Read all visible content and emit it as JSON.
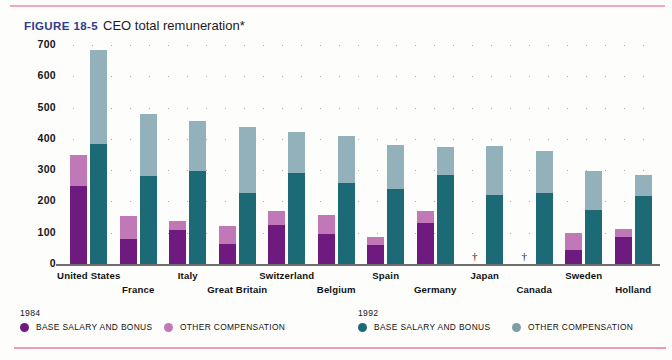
{
  "figure": {
    "label": "FIGURE 18-5",
    "title": "CEO total remuneration*"
  },
  "legend": {
    "year_1984": "1984",
    "year_1992": "1992",
    "entries": [
      {
        "year": "1984",
        "label": "BASE SALARY AND BONUS",
        "color": "#6e1a7e"
      },
      {
        "year": "1984",
        "label": "OTHER COMPENSATION",
        "color": "#c078b6"
      },
      {
        "year": "1992",
        "label": "BASE SALARY AND BONUS",
        "color": "#1d6a77"
      },
      {
        "year": "1992",
        "label": "OTHER COMPENSATION",
        "color": "#7f9da6"
      }
    ]
  },
  "missing_marker": "†",
  "chart_data": {
    "type": "bar",
    "subtype": "grouped-stacked",
    "title": "CEO total remuneration*",
    "xlabel": "",
    "ylabel": "",
    "ylim": [
      0,
      700
    ],
    "yticks": [
      0,
      100,
      200,
      300,
      400,
      500,
      600,
      700
    ],
    "ytick_labels": [
      "0",
      "100",
      "200",
      "300",
      "400",
      "500",
      "600",
      "700"
    ],
    "grid": "dotted-horizontal",
    "legend_position": "bottom",
    "categories": [
      "United States",
      "France",
      "Italy",
      "Great Britain",
      "Switzerland",
      "Belgium",
      "Spain",
      "Germany",
      "Japan",
      "Canada",
      "Sweden",
      "Holland"
    ],
    "series": [
      {
        "name": "1984 BASE SALARY AND BONUS",
        "color": "#6e1a7e",
        "values": [
          250,
          80,
          110,
          65,
          125,
          95,
          62,
          130,
          null,
          null,
          45,
          85
        ]
      },
      {
        "name": "1984 OTHER COMPENSATION",
        "color": "#c078b6",
        "values": [
          100,
          72,
          28,
          58,
          45,
          63,
          23,
          40,
          null,
          null,
          55,
          28
        ]
      },
      {
        "name": "1992 BASE SALARY AND BONUS",
        "color": "#1d6a77",
        "values": [
          385,
          282,
          298,
          228,
          292,
          260,
          240,
          283,
          222,
          228,
          172,
          218
        ]
      },
      {
        "name": "1992 OTHER COMPENSATION",
        "color": "#93b1ba",
        "values": [
          300,
          198,
          158,
          210,
          130,
          148,
          142,
          92,
          155,
          132,
          125,
          68
        ]
      }
    ],
    "totals_1984": [
      350,
      152,
      138,
      123,
      170,
      158,
      85,
      170,
      null,
      null,
      100,
      113
    ],
    "totals_1992": [
      685,
      480,
      456,
      438,
      422,
      408,
      382,
      375,
      377,
      360,
      297,
      286
    ],
    "annotations": [
      {
        "category": "Japan",
        "series": "1984",
        "marker": "†"
      },
      {
        "category": "Canada",
        "series": "1984",
        "marker": "†"
      }
    ]
  }
}
